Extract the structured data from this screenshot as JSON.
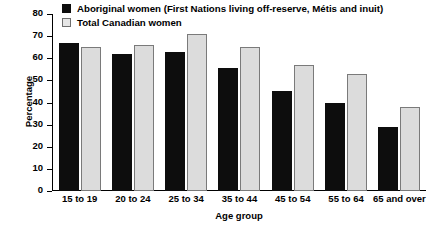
{
  "chart_data": {
    "type": "bar",
    "title": "",
    "xlabel": "Age group",
    "ylabel": "Percentage",
    "ylim": [
      0,
      80
    ],
    "yticks": [
      0,
      10,
      20,
      30,
      40,
      50,
      60,
      70,
      80
    ],
    "grid": false,
    "legend_position": "top-left",
    "categories": [
      "15 to 19",
      "20 to 24",
      "25 to 34",
      "35 to 44",
      "45 to 54",
      "55 to 64",
      "65 and over"
    ],
    "series": [
      {
        "name": "Aboriginal women (First Nations living off-reserve, Métis and inuit)",
        "color": "#0d0d0d",
        "values": [
          67,
          62,
          63,
          55.5,
          45,
          40,
          29
        ]
      },
      {
        "name": "Total Canadian women",
        "color": "#dcdcdc",
        "values": [
          65,
          66,
          71,
          65,
          57,
          53,
          38
        ]
      }
    ]
  },
  "legend": {
    "items": [
      {
        "label": "Aboriginal women (First Nations living off-reserve, Métis and inuit)",
        "swatch": "filled-black-square"
      },
      {
        "label": "Total Canadian women",
        "swatch": "outlined-gray-square"
      }
    ]
  },
  "axes": {
    "y_title": "Percentage",
    "x_title": "Age group",
    "y_tick_labels": [
      "80",
      "70",
      "60",
      "50",
      "40",
      "30",
      "20",
      "10",
      "0"
    ],
    "x_tick_labels": [
      "15 to 19",
      "20 to 24",
      "25 to 34",
      "35 to 44",
      "45 to 54",
      "55 to 64",
      "65 and over"
    ]
  }
}
